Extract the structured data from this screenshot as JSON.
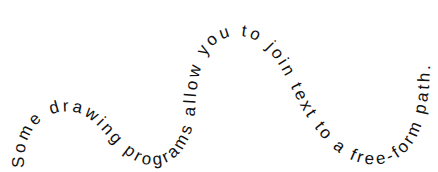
{
  "figure": {
    "type": "text-on-path illustration",
    "text": "Some drawing programs allow you to join text to a free-form path.",
    "text_color": "#111111",
    "background_color": "#ffffff",
    "path": "M 24,168 C 22,120 55,108 75,112 C 100,117 110,150 140,163 C 170,172 192,150 195,110 C 197,70 205,38 235,36 C 268,34 282,70 300,105 C 320,140 345,168 380,164 C 415,160 430,120 430,62"
  }
}
